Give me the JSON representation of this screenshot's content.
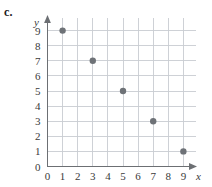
{
  "figure": {
    "part_label": "c.",
    "point_color": "#6e7277",
    "grid_color": "#c9ccd1",
    "axis_color": "#6c6f73"
  },
  "chart_data": {
    "type": "scatter",
    "title": "",
    "xlabel": "x",
    "ylabel": "y",
    "xlim": [
      0,
      9
    ],
    "ylim": [
      0,
      9
    ],
    "grid": true,
    "legend": "none",
    "x_ticks": [
      0,
      1,
      2,
      3,
      4,
      5,
      6,
      7,
      8,
      9
    ],
    "y_ticks": [
      0,
      1,
      2,
      3,
      4,
      5,
      6,
      7,
      8,
      9
    ],
    "x_tick_labels": [
      "0",
      "1",
      "2",
      "3",
      "4",
      "5",
      "6",
      "7",
      "8",
      "9"
    ],
    "y_tick_labels": [
      "0",
      "1",
      "2",
      "3",
      "4",
      "5",
      "6",
      "7",
      "8",
      "9"
    ],
    "x": [
      1,
      3,
      5,
      7,
      9
    ],
    "y": [
      9,
      7,
      5,
      3,
      1
    ],
    "points": [
      {
        "x": 1,
        "y": 9
      },
      {
        "x": 3,
        "y": 7
      },
      {
        "x": 5,
        "y": 5
      },
      {
        "x": 7,
        "y": 3
      },
      {
        "x": 9,
        "y": 1
      }
    ]
  }
}
